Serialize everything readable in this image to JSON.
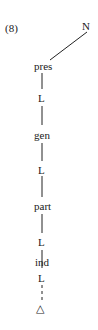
{
  "example_number": "(8)",
  "tree": {
    "root": "N",
    "nodes": [
      "pres",
      "L",
      "gen",
      "L",
      "part",
      "L",
      "ind",
      "L"
    ],
    "terminal": "△"
  }
}
